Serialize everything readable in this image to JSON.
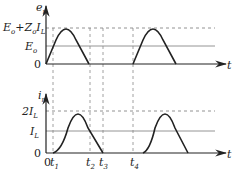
{
  "top_plot": {
    "y_axis_label": "e",
    "y_axis_sub": "r",
    "x_axis_label": "t",
    "levels": [
      {
        "label": "E",
        "sub": "o",
        "suffix": "+Z",
        "suffix_sub": "o",
        "tail": "I",
        "tail_sub": "L"
      },
      {
        "label": "E",
        "sub": "o"
      },
      {
        "label": "0"
      }
    ]
  },
  "bottom_plot": {
    "y_axis_label": "i",
    "y_axis_sub": "r",
    "x_axis_label": "t",
    "levels": [
      {
        "label": "2I",
        "sub": "L"
      },
      {
        "label": "I",
        "sub": "L"
      },
      {
        "label": "0"
      }
    ],
    "x_ticks": [
      {
        "label": "0"
      },
      {
        "label": "t",
        "sub": "1"
      },
      {
        "label": "t",
        "sub": "2"
      },
      {
        "label": "t",
        "sub": "3"
      },
      {
        "label": "t",
        "sub": "4"
      }
    ]
  },
  "colors": {
    "curve": "#222222",
    "axis": "#222222",
    "level_line": "#888888",
    "dashed": "#777777"
  }
}
